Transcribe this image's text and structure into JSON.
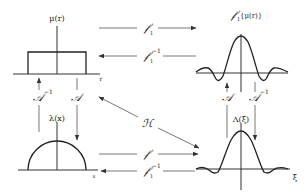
{
  "panels": {
    "top_left": {
      "title": "μ(r)",
      "axis_label": "r",
      "shape": "rectangle"
    },
    "top_right": {
      "title_op": "𝒻",
      "title_sub": "1",
      "title_arg": "{μ(r)}",
      "shape": "sinc"
    },
    "bottom_left": {
      "title": "λ(x)",
      "axis_label": "x",
      "shape": "semicircle"
    },
    "bottom_right": {
      "title": "Λ(ξ)",
      "axis_label": "ξ",
      "shape": "jinc"
    }
  },
  "operators": {
    "top_forward": {
      "symbol": "𝒻",
      "sub": "1",
      "sup": ""
    },
    "top_inverse": {
      "symbol": "𝒻",
      "sub": "1",
      "sup": "−1"
    },
    "bottom_forward": {
      "symbol": "𝒻",
      "sub": "",
      "sup": ""
    },
    "bottom_inverse": {
      "symbol": "𝒻",
      "sub": "1",
      "sup": "−1"
    },
    "left_up": {
      "symbol": "𝒜",
      "sup": "−1"
    },
    "left_down": {
      "symbol": "𝒜",
      "sup": ""
    },
    "right_up": {
      "symbol": "𝒜",
      "sup": ""
    },
    "right_down": {
      "symbol": "𝒜",
      "sup": "−1"
    },
    "diagonal": {
      "symbol": "ℋ"
    }
  },
  "colors": {
    "ink": "#222222",
    "background": "#ffffff"
  }
}
